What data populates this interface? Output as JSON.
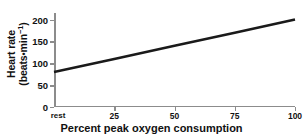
{
  "chart_data": {
    "type": "line",
    "title": "",
    "subtitle": "",
    "xlabel": "Percent peak oxygen consumption",
    "ylabel_line1": "Heart rate",
    "ylabel_line2_prefix": "(beats",
    "ylabel_line2_dot": "•",
    "ylabel_line2_mid": "min",
    "ylabel_line2_sup": "−1",
    "ylabel_line2_suffix": ")",
    "ylabel_full": "Heart rate (beats•min−1)",
    "xlim": [
      0,
      100
    ],
    "ylim": [
      0,
      215
    ],
    "grid": false,
    "legend": "none",
    "xticks": [
      {
        "value": 0,
        "label": "rest"
      },
      {
        "value": 25,
        "label": "25"
      },
      {
        "value": 50,
        "label": "50"
      },
      {
        "value": 75,
        "label": "75"
      },
      {
        "value": 100,
        "label": "100"
      }
    ],
    "yticks": [
      {
        "value": 0,
        "label": "0"
      },
      {
        "value": 50,
        "label": "50"
      },
      {
        "value": 100,
        "label": "100"
      },
      {
        "value": 150,
        "label": "150"
      },
      {
        "value": 200,
        "label": "200"
      }
    ],
    "series": [
      {
        "name": "heart-rate-response",
        "color": "#1a1a1a",
        "line_width": 2.6,
        "x": [
          0,
          25,
          50,
          75,
          100
        ],
        "y": [
          80,
          110,
          140,
          170,
          200
        ]
      }
    ],
    "axis_color": "#8c8c8c",
    "text_color": "#111111",
    "background": "#ffffff"
  }
}
